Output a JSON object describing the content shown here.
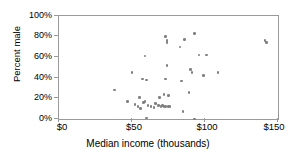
{
  "chart_data": {
    "type": "scatter",
    "title": "",
    "xlabel": "Median income (thousands)",
    "ylabel": "Percent male",
    "xlim": [
      0,
      150
    ],
    "ylim": [
      0,
      100
    ],
    "xticks": [
      0,
      50,
      100,
      150
    ],
    "yticks": [
      0,
      20,
      40,
      60,
      80,
      100
    ],
    "xtick_labels": [
      "$0",
      "$50",
      "$100",
      "$150"
    ],
    "ytick_labels": [
      "0%",
      "20%",
      "40%",
      "60%",
      "80%",
      "100%"
    ],
    "grid": false,
    "legend": false,
    "marker_color": "#808080",
    "frame_color": "#9a9a9a",
    "points": [
      {
        "x": 38,
        "y": 28
      },
      {
        "x": 47,
        "y": 17
      },
      {
        "x": 50,
        "y": 45
      },
      {
        "x": 52,
        "y": 14
      },
      {
        "x": 54,
        "y": 12
      },
      {
        "x": 55,
        "y": 21
      },
      {
        "x": 56,
        "y": 10
      },
      {
        "x": 57,
        "y": 39
      },
      {
        "x": 58,
        "y": 16
      },
      {
        "x": 59,
        "y": 61
      },
      {
        "x": 59,
        "y": 17
      },
      {
        "x": 60,
        "y": 1
      },
      {
        "x": 60,
        "y": 38
      },
      {
        "x": 61,
        "y": 13
      },
      {
        "x": 63,
        "y": 12
      },
      {
        "x": 65,
        "y": 11
      },
      {
        "x": 66,
        "y": 15
      },
      {
        "x": 68,
        "y": 13
      },
      {
        "x": 69,
        "y": 21
      },
      {
        "x": 70,
        "y": 12
      },
      {
        "x": 71,
        "y": 13
      },
      {
        "x": 72,
        "y": 12
      },
      {
        "x": 72,
        "y": 24
      },
      {
        "x": 73,
        "y": 80
      },
      {
        "x": 73,
        "y": 39
      },
      {
        "x": 73,
        "y": 12
      },
      {
        "x": 74,
        "y": 52
      },
      {
        "x": 74,
        "y": 76
      },
      {
        "x": 74,
        "y": 74
      },
      {
        "x": 75,
        "y": 23
      },
      {
        "x": 75,
        "y": 12
      },
      {
        "x": 76,
        "y": 12
      },
      {
        "x": 83,
        "y": 70
      },
      {
        "x": 84,
        "y": 37
      },
      {
        "x": 85,
        "y": 7
      },
      {
        "x": 86,
        "y": 77
      },
      {
        "x": 89,
        "y": 26
      },
      {
        "x": 90,
        "y": 48
      },
      {
        "x": 91,
        "y": 45
      },
      {
        "x": 93,
        "y": 83
      },
      {
        "x": 93,
        "y": 0
      },
      {
        "x": 96,
        "y": 62
      },
      {
        "x": 99,
        "y": 42
      },
      {
        "x": 101,
        "y": 62
      },
      {
        "x": 109,
        "y": 45
      },
      {
        "x": 141,
        "y": 76
      },
      {
        "x": 142,
        "y": 74
      }
    ]
  }
}
